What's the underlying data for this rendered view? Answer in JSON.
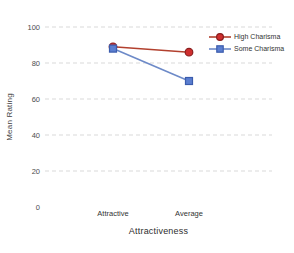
{
  "chart_data": {
    "type": "line",
    "title": "",
    "categories": [
      "Attractive",
      "Average"
    ],
    "series": [
      {
        "name": "High Charisma",
        "values": [
          89,
          86
        ],
        "marker": "circle",
        "color": "#b2402e",
        "marker_fill": "#cf2e2e",
        "marker_stroke": "#8a1f1f"
      },
      {
        "name": "Some Charisma",
        "values": [
          88,
          70
        ],
        "marker": "square",
        "color": "#6d8ac8",
        "marker_fill": "#5b7ed0",
        "marker_stroke": "#3b5cad"
      }
    ],
    "xlabel": "Attractiveness",
    "ylabel": "Mean Rating",
    "ylim": [
      0,
      100
    ],
    "yticks": [
      0,
      20,
      40,
      60,
      80,
      100
    ],
    "grid": "horizontal-dashed",
    "grid_color": "#d9d9d9",
    "legend_position": "top-right",
    "tick_color": "#4d4d4d"
  }
}
